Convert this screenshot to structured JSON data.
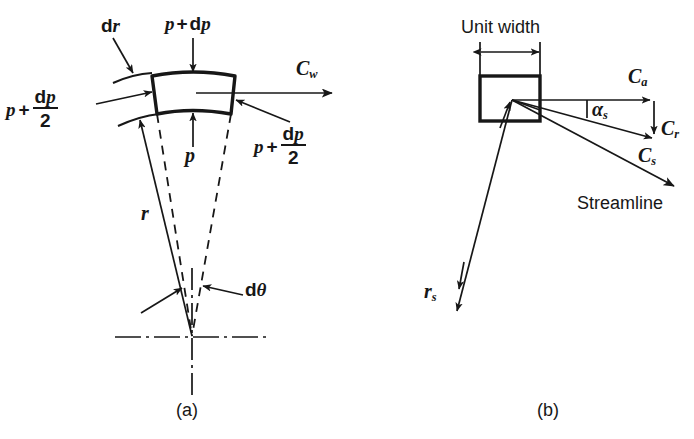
{
  "figure": {
    "background_color": "#ffffff",
    "ink_color": "#171717",
    "panels": [
      {
        "id": "a",
        "caption": "(a)",
        "description": "Fluid element in radial equilibrium",
        "labels": {
          "dr": {
            "d": "d",
            "var": "r",
            "text": "dr"
          },
          "p_plus_dp_top": {
            "p": "p",
            "plus": "+",
            "d": "d",
            "var": "p",
            "text": "p + dp"
          },
          "c_w": {
            "base": "C",
            "sub": "w",
            "text": "Cw"
          },
          "p_plus_dp_over_2_left": {
            "p": "p",
            "plus": "+",
            "num_d": "d",
            "num_var": "p",
            "den": "2",
            "text": "p + dp/2"
          },
          "p_plus_dp_over_2_right": {
            "p": "p",
            "plus": "+",
            "num_d": "d",
            "num_var": "p",
            "den": "2",
            "text": "p + dp/2"
          },
          "p_bottom": {
            "var": "p",
            "text": "p"
          },
          "r": {
            "var": "r",
            "text": "r"
          },
          "d_theta": {
            "d": "d",
            "var": "θ",
            "text": "dθ"
          }
        }
      },
      {
        "id": "b",
        "caption": "(b)",
        "description": "Velocity components on a streamline",
        "labels": {
          "unit_width": {
            "text": "Unit width"
          },
          "c_a": {
            "base": "C",
            "sub": "a",
            "text": "Ca"
          },
          "c_r": {
            "base": "C",
            "sub": "r",
            "text": "Cr"
          },
          "c_s": {
            "base": "C",
            "sub": "s",
            "text": "Cs"
          },
          "alpha_s": {
            "base": "α",
            "sub": "s",
            "text": "αs"
          },
          "streamline": {
            "text": "Streamline"
          },
          "r_s": {
            "base": "r",
            "sub": "s",
            "text": "rs"
          }
        }
      }
    ]
  }
}
